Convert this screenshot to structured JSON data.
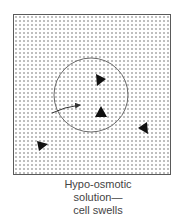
{
  "figure": {
    "type": "osmosis-diagram",
    "container": {
      "x": 13,
      "y": 14,
      "width": 158,
      "height": 161,
      "border_color": "#555555"
    },
    "dot_pattern": {
      "spacing": 4,
      "color": "#6a6a6a",
      "dot_radius": 0.7
    },
    "cell": {
      "cx": 91,
      "cy": 95,
      "r": 37,
      "stroke": "#666666"
    },
    "water_arrow": {
      "from": [
        52,
        112
      ],
      "to": [
        80,
        105
      ],
      "label": "water-flow-into-cell"
    },
    "solute_particles": [
      {
        "x": 100,
        "y": 80,
        "rotation": 30
      },
      {
        "x": 101,
        "y": 113,
        "rotation": -90
      },
      {
        "x": 144,
        "y": 128,
        "rotation": 200
      },
      {
        "x": 42,
        "y": 145,
        "rotation": -20
      }
    ],
    "colors": {
      "particle": "#111111",
      "background": "#ffffff"
    }
  },
  "caption": {
    "line1": "Hypo-osmotic",
    "line2": "solution—",
    "line3": "cell swells"
  }
}
